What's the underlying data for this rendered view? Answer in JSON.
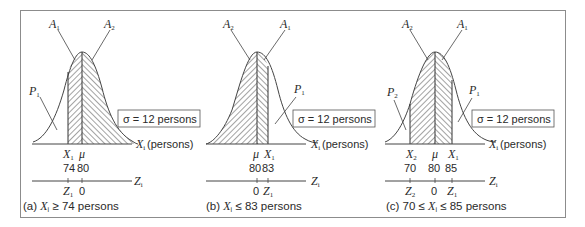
{
  "figure": {
    "sigma_label": "σ = 12 persons",
    "x_axis_label": "(persons)",
    "x_var": "X",
    "z_var": "Z",
    "mean_symbol": "μ",
    "sigma": 12,
    "mean": 80
  },
  "panels": [
    {
      "id": "a",
      "caption_prefix": "(a)",
      "caption_rest": "≥ 74 persons",
      "area_labels": [
        "A1",
        "A2"
      ],
      "population_labels": [
        "P1"
      ],
      "x_ticks": [
        {
          "symbol": "X1",
          "value": "74"
        },
        {
          "symbol": "μ",
          "value": "80"
        }
      ],
      "z_ticks": [
        {
          "symbol": "Z1"
        },
        {
          "value": "0"
        }
      ]
    },
    {
      "id": "b",
      "caption_prefix": "(b)",
      "caption_rest": "≤ 83 persons",
      "area_labels": [
        "A2",
        "A1"
      ],
      "population_labels": [
        "P1"
      ],
      "x_ticks": [
        {
          "symbol": "μ",
          "value": "80"
        },
        {
          "symbol": "X1",
          "value": "83"
        }
      ],
      "z_ticks": [
        {
          "value": "0"
        },
        {
          "symbol": "Z1"
        }
      ]
    },
    {
      "id": "c",
      "caption_prefix": "(c)",
      "caption_rest": "70 ≤ X ≤ 85 persons",
      "area_labels": [
        "A2",
        "A1"
      ],
      "population_labels": [
        "P2",
        "P1"
      ],
      "x_ticks": [
        {
          "symbol": "X2",
          "value": "70"
        },
        {
          "symbol": "μ",
          "value": "80"
        },
        {
          "symbol": "X1",
          "value": "85"
        }
      ],
      "z_ticks": [
        {
          "symbol": "Z2"
        },
        {
          "value": "0"
        },
        {
          "symbol": "Z1"
        }
      ]
    }
  ],
  "text": {
    "a_val1": "74",
    "a_val2": "80",
    "a_zero": "0",
    "b_val1": "80",
    "b_val2": "83",
    "b_zero": "0",
    "c_val1": "70",
    "c_val2": "80",
    "c_val3": "85",
    "c_zero": "0",
    "a_cap": "(a)",
    "a_cap_rest": "≥ 74 persons",
    "b_cap": "(b)",
    "b_cap_rest": "≤ 83 persons",
    "c_cap": "(c) 70 ≤",
    "c_cap_rest": "≤ 85 persons",
    "persons": "(persons)",
    "sigma": "σ = 12 persons",
    "mu": "μ",
    "A": "A",
    "P": "P",
    "X": "X",
    "Z": "Z",
    "s1": "1",
    "s2": "2",
    "si": "i"
  }
}
